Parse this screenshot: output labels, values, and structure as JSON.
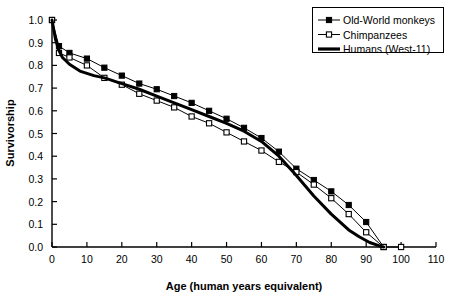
{
  "chart_data": {
    "type": "line",
    "title": "",
    "xlabel": "Age (human years equivalent)",
    "ylabel": "Survivorship",
    "xlim": [
      0,
      110
    ],
    "ylim": [
      0.0,
      1.0
    ],
    "xticks": [
      0,
      10,
      20,
      30,
      40,
      50,
      60,
      70,
      80,
      90,
      100,
      110
    ],
    "xtick_labels": [
      "0",
      "10",
      "20",
      "30",
      "40",
      "50",
      "60",
      "70",
      "80",
      "90",
      "100",
      "110"
    ],
    "yticks": [
      0.0,
      0.1,
      0.2,
      0.3,
      0.4,
      0.5,
      0.6,
      0.7,
      0.8,
      0.9,
      1.0
    ],
    "ytick_labels": [
      "0.0",
      "0.1",
      "0.2",
      "0.3",
      "0.4",
      "0.5",
      "0.6",
      "0.7",
      "0.8",
      "0.9",
      "1.0"
    ],
    "grid": false,
    "legend_position": "top-right",
    "series": [
      {
        "name": "Old-World monkeys",
        "marker": "filled-square",
        "color": "#000000",
        "line_width": 1,
        "x": [
          0,
          2,
          5,
          10,
          15,
          20,
          25,
          30,
          35,
          40,
          45,
          50,
          55,
          60,
          65,
          70,
          75,
          80,
          85,
          90,
          95
        ],
        "y": [
          1.0,
          0.885,
          0.855,
          0.83,
          0.79,
          0.755,
          0.72,
          0.695,
          0.665,
          0.635,
          0.6,
          0.565,
          0.525,
          0.48,
          0.42,
          0.345,
          0.295,
          0.245,
          0.185,
          0.11,
          0.0
        ]
      },
      {
        "name": "Chimpanzees",
        "marker": "open-square",
        "color": "#000000",
        "line_width": 1,
        "x": [
          0,
          2,
          5,
          10,
          15,
          20,
          25,
          30,
          35,
          40,
          45,
          50,
          55,
          60,
          65,
          70,
          75,
          80,
          85,
          90,
          95,
          100
        ],
        "y": [
          1.0,
          0.855,
          0.835,
          0.8,
          0.745,
          0.715,
          0.675,
          0.645,
          0.615,
          0.575,
          0.545,
          0.505,
          0.465,
          0.425,
          0.375,
          0.33,
          0.275,
          0.215,
          0.145,
          0.065,
          0.0,
          0.0
        ]
      },
      {
        "name": "Humans (West-11)",
        "marker": "none",
        "color": "#000000",
        "line_width": 3,
        "x": [
          0,
          1,
          2,
          3,
          5,
          8,
          12,
          15,
          20,
          25,
          30,
          35,
          40,
          45,
          50,
          55,
          60,
          65,
          70,
          75,
          80,
          85,
          88,
          91,
          94,
          95
        ],
        "y": [
          1.0,
          0.915,
          0.865,
          0.835,
          0.805,
          0.775,
          0.755,
          0.745,
          0.72,
          0.695,
          0.665,
          0.635,
          0.605,
          0.575,
          0.545,
          0.51,
          0.465,
          0.4,
          0.315,
          0.225,
          0.145,
          0.075,
          0.045,
          0.02,
          0.004,
          0.0
        ]
      }
    ]
  },
  "legend": {
    "entries": [
      {
        "label": "Old-World monkeys",
        "marker": "filled-square"
      },
      {
        "label": "Chimpanzees",
        "marker": "open-square"
      },
      {
        "label": "Humans (West-11)",
        "marker": "thick-line"
      }
    ]
  }
}
